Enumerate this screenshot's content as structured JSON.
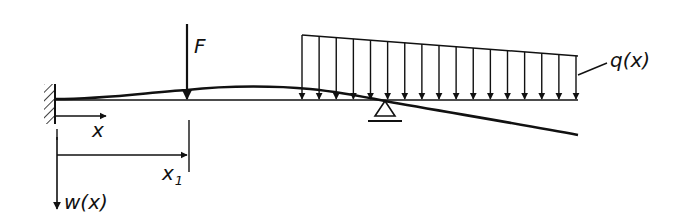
{
  "diagram": {
    "type": "beam-loading-sketch",
    "labels": {
      "force": "F",
      "distributed_load": "q(x)",
      "x_axis": "x",
      "x1_base": "x",
      "x1_sub": "1",
      "deflection": "w(x)"
    },
    "elements": {
      "support_left": "fixed-clamp",
      "support_mid": "pin-roller-triangle",
      "load_arrow_count": 17
    },
    "colors": {
      "ink": "#111111",
      "background": "#ffffff"
    }
  }
}
